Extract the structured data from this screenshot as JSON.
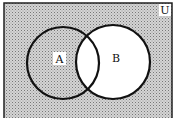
{
  "diagram": {
    "type": "venn",
    "universe_label": "U",
    "sets": [
      {
        "label": "A"
      },
      {
        "label": "B"
      }
    ],
    "shaded_region": "complement of B",
    "colors": {
      "shade": "#b8b8b8",
      "line": "#111111",
      "background": "#ffffff"
    }
  }
}
